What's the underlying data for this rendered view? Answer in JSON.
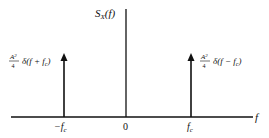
{
  "diagram": {
    "y_axis_label": {
      "main": "S",
      "sub": "X",
      "arg": "(f)"
    },
    "x_axis_label": "f",
    "ticks": [
      {
        "label_sign": "−",
        "label_main": "f",
        "label_sub": "c",
        "position": "-fc"
      },
      {
        "label_main": "0",
        "position": "0"
      },
      {
        "label_main": "f",
        "label_sub": "c",
        "position": "fc"
      }
    ],
    "impulses": [
      {
        "location": "-fc",
        "numerator": "A",
        "numerator_sup": "2",
        "denominator": "4",
        "expr": "δ(f + f",
        "expr_sub": "c",
        "expr_close": ")"
      },
      {
        "location": "fc",
        "numerator": "A",
        "numerator_sup": "2",
        "denominator": "4",
        "expr": "δ(f − f",
        "expr_sub": "c",
        "expr_close": ")"
      }
    ],
    "colors": {
      "line": "#111111",
      "background": "#ffffff"
    }
  }
}
